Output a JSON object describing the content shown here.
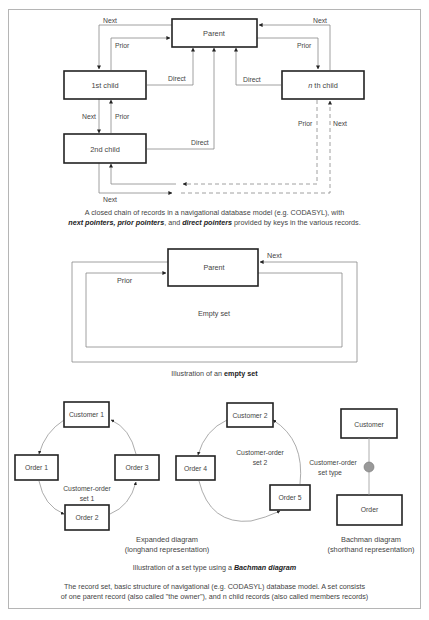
{
  "diagram1": {
    "records": {
      "parent": "Parent",
      "first_child": "1st child",
      "second_child": "2nd child",
      "nth_child_italic": "n",
      "nth_child_rest": " th child"
    },
    "labels": {
      "next": "Next",
      "prior": "Prior",
      "direct": "Direct"
    },
    "caption": {
      "line1": "A closed chain of records in a navigational database model (e.g. CODASYL), with",
      "bold1": "next pointers, prior pointers",
      "sep1": ", and ",
      "bold2": "direct pointers",
      "rest": " provided by keys in the various records."
    }
  },
  "diagram2": {
    "parent": "Parent",
    "next": "Next",
    "prior": "Prior",
    "empty_set": "Empty set",
    "caption_prefix": "Illustration of an ",
    "caption_bold": "empty set"
  },
  "diagram3": {
    "set1": {
      "owner": "Customer 1",
      "members": [
        "Order 1",
        "Order 2",
        "Order 3"
      ],
      "label_line1": "Customer-order",
      "label_line2": "set 1"
    },
    "set2": {
      "owner": "Customer 2",
      "members": [
        "Order 4",
        "Order 5"
      ],
      "label_line1": "Customer-order",
      "label_line2": "set 2"
    },
    "bachman": {
      "owner": "Customer",
      "member": "Order",
      "label_line1": "Customer-order",
      "label_line2": "set type",
      "connector_color": "#999999"
    },
    "expanded_caption_line1": "Expanded diagram",
    "expanded_caption_line2": "(longhand representation)",
    "bachman_caption_line1": "Bachman diagram",
    "bachman_caption_line2": "(shorthand representation)",
    "caption_prefix": "Illustration of a set type using a ",
    "caption_bold": "Bachman diagram"
  },
  "footer": {
    "line1": "The record set, basic structure of navigational (e.g. CODASYL) database model. A set consists",
    "line2": "of one parent record (also called \"the owner\"), and n child records (also called members records)"
  }
}
